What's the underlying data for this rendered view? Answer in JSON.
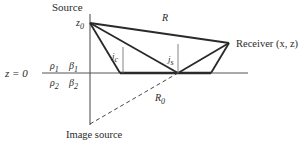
{
  "diagram": {
    "labels": {
      "source": "Source",
      "z0": "z",
      "z0_sub": "0",
      "R": "R",
      "receiver": "Receiver (x, z)",
      "interface": "z = 0",
      "rho1": "ρ",
      "rho1_sub": "1",
      "beta1": "β",
      "beta1_sub": "1",
      "rho2": "ρ",
      "rho2_sub": "2",
      "beta2": "β",
      "beta2_sub": "2",
      "jc": "j",
      "jc_sub": "c",
      "js": "j",
      "js_sub": "s",
      "R0": "R",
      "R0_sub": "0",
      "image_source": "Image source"
    },
    "colors": {
      "line": "#2a2a2a",
      "thin": "#555555"
    }
  }
}
